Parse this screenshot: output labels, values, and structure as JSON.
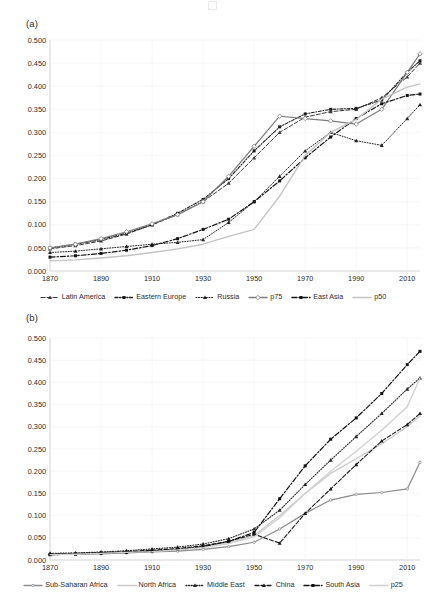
{
  "figure": {
    "width": 426,
    "height": 596,
    "background": "#ffffff",
    "axis_color": "#d9d9d9",
    "grid_color": "#f0f0f0",
    "text_color": "#2b2b2b"
  },
  "panels": [
    {
      "id": "a",
      "label": "(a)",
      "legend_position": "bottom"
    },
    {
      "id": "b",
      "label": "(b)",
      "legend_position": "bottom"
    }
  ],
  "chart_data": [
    {
      "type": "line",
      "panel": "(a)",
      "title": "",
      "xlabel": "",
      "ylabel": "",
      "xlim": [
        1870,
        2015
      ],
      "ylim": [
        0.0,
        0.5
      ],
      "xticks": [
        1870,
        1890,
        1910,
        1930,
        1950,
        1970,
        1990,
        2010
      ],
      "yticks": [
        0.0,
        0.05,
        0.1,
        0.15,
        0.2,
        0.25,
        0.3,
        0.35,
        0.4,
        0.45,
        0.5
      ],
      "ytick_labels": [
        "0.000",
        "0.050",
        "0.100",
        "0.150",
        "0.200",
        "0.250",
        "0.300",
        "0.350",
        "0.400",
        "0.450",
        "0.500"
      ],
      "xtick_labels": [
        "1870",
        "1890",
        "1910",
        "1930",
        "1950",
        "1970",
        "1990",
        "2010"
      ],
      "grid": true,
      "legend": [
        "Latin America",
        "Eastern Europe",
        "Russia",
        "p75",
        "East Asia",
        "p50"
      ],
      "series": [
        {
          "name": "Latin America",
          "color": "#3a3a3a",
          "dash": "4,2",
          "width": 1.0,
          "marker": "triangle",
          "x": [
            1870,
            1880,
            1890,
            1900,
            1910,
            1920,
            1930,
            1940,
            1950,
            1960,
            1970,
            1980,
            1990,
            2000,
            2010,
            2015
          ],
          "values": [
            0.048,
            0.055,
            0.065,
            0.08,
            0.1,
            0.122,
            0.15,
            0.19,
            0.245,
            0.3,
            0.333,
            0.345,
            0.35,
            0.375,
            0.42,
            0.45
          ]
        },
        {
          "name": "Eastern Europe",
          "color": "#1b1b1b",
          "dash": "3,1.6,1,1.6",
          "width": 1.1,
          "marker": "square",
          "x": [
            1870,
            1880,
            1890,
            1900,
            1910,
            1920,
            1930,
            1940,
            1950,
            1960,
            1970,
            1980,
            1990,
            2000,
            2010,
            2015
          ],
          "values": [
            0.05,
            0.058,
            0.068,
            0.082,
            0.1,
            0.125,
            0.155,
            0.2,
            0.26,
            0.312,
            0.34,
            0.35,
            0.352,
            0.37,
            0.43,
            0.455
          ]
        },
        {
          "name": "Russia",
          "color": "#232323",
          "dash": "1,1.6",
          "width": 1.0,
          "marker": "triangle",
          "x": [
            1870,
            1880,
            1890,
            1900,
            1910,
            1920,
            1930,
            1940,
            1950,
            1960,
            1970,
            1980,
            1990,
            2000,
            2010,
            2015
          ],
          "values": [
            0.04,
            0.043,
            0.048,
            0.053,
            0.058,
            0.062,
            0.068,
            0.105,
            0.15,
            0.205,
            0.26,
            0.3,
            0.282,
            0.272,
            0.33,
            0.36
          ]
        },
        {
          "name": "p75",
          "color": "#7d7d7d",
          "dash": "0",
          "width": 1.2,
          "marker": "diamond",
          "x": [
            1870,
            1880,
            1890,
            1900,
            1910,
            1920,
            1930,
            1940,
            1950,
            1960,
            1970,
            1980,
            1990,
            2000,
            2010,
            2015
          ],
          "values": [
            0.05,
            0.058,
            0.07,
            0.085,
            0.102,
            0.122,
            0.15,
            0.205,
            0.27,
            0.335,
            0.33,
            0.325,
            0.318,
            0.35,
            0.43,
            0.47
          ]
        },
        {
          "name": "East Asia",
          "color": "#141414",
          "dash": "5,2,1.4,2",
          "width": 1.2,
          "marker": "square",
          "x": [
            1870,
            1880,
            1890,
            1900,
            1910,
            1920,
            1930,
            1940,
            1950,
            1960,
            1970,
            1980,
            1990,
            2000,
            2010,
            2015
          ],
          "values": [
            0.03,
            0.033,
            0.038,
            0.045,
            0.055,
            0.07,
            0.09,
            0.112,
            0.15,
            0.195,
            0.245,
            0.29,
            0.33,
            0.362,
            0.38,
            0.383
          ]
        },
        {
          "name": "p50",
          "color": "#c3c3c3",
          "dash": "0",
          "width": 1.4,
          "marker": "none",
          "x": [
            1870,
            1880,
            1890,
            1900,
            1910,
            1920,
            1930,
            1940,
            1950,
            1960,
            1970,
            1980,
            1990,
            2000,
            2010,
            2015
          ],
          "values": [
            0.022,
            0.024,
            0.028,
            0.033,
            0.04,
            0.048,
            0.058,
            0.075,
            0.09,
            0.162,
            0.25,
            0.3,
            0.328,
            0.372,
            0.398,
            0.405
          ]
        }
      ]
    },
    {
      "type": "line",
      "panel": "(b)",
      "title": "",
      "xlabel": "",
      "ylabel": "",
      "xlim": [
        1870,
        2015
      ],
      "ylim": [
        0.0,
        0.5
      ],
      "xticks": [
        1870,
        1890,
        1910,
        1930,
        1950,
        1970,
        1990,
        2010
      ],
      "yticks": [
        0.0,
        0.05,
        0.1,
        0.15,
        0.2,
        0.25,
        0.3,
        0.35,
        0.4,
        0.45,
        0.5
      ],
      "ytick_labels": [
        "0.000",
        "0.050",
        "0.100",
        "0.150",
        "0.200",
        "0.250",
        "0.300",
        "0.350",
        "0.400",
        "0.450",
        "0.500"
      ],
      "xtick_labels": [
        "1870",
        "1890",
        "1910",
        "1930",
        "1950",
        "1970",
        "1990",
        "2010"
      ],
      "grid": true,
      "legend": [
        "Sub-Saharan Africa",
        "North Africa",
        "Middle East",
        "China",
        "South Asia",
        "p25"
      ],
      "series": [
        {
          "name": "Sub-Saharan Africa",
          "color": "#8a8a8a",
          "dash": "0",
          "width": 1.2,
          "marker": "dot",
          "x": [
            1870,
            1880,
            1890,
            1900,
            1910,
            1920,
            1930,
            1940,
            1950,
            1960,
            1970,
            1980,
            1990,
            2000,
            2010,
            2015
          ],
          "values": [
            0.012,
            0.013,
            0.014,
            0.016,
            0.018,
            0.02,
            0.024,
            0.03,
            0.04,
            0.07,
            0.105,
            0.135,
            0.148,
            0.152,
            0.16,
            0.22
          ]
        },
        {
          "name": "North Africa",
          "color": "#c9c9c9",
          "dash": "0",
          "width": 1.3,
          "marker": "none",
          "x": [
            1870,
            1880,
            1890,
            1900,
            1910,
            1920,
            1930,
            1940,
            1950,
            1960,
            1970,
            1980,
            1990,
            2000,
            2010,
            2015
          ],
          "values": [
            0.013,
            0.014,
            0.016,
            0.018,
            0.021,
            0.024,
            0.03,
            0.04,
            0.055,
            0.1,
            0.15,
            0.195,
            0.228,
            0.262,
            0.3,
            0.325
          ]
        },
        {
          "name": "Middle East",
          "color": "#262626",
          "dash": "1,1.6",
          "width": 1.1,
          "marker": "triangle",
          "x": [
            1870,
            1880,
            1890,
            1900,
            1910,
            1920,
            1930,
            1940,
            1950,
            1960,
            1970,
            1980,
            1990,
            2000,
            2010,
            2015
          ],
          "values": [
            0.015,
            0.016,
            0.018,
            0.021,
            0.025,
            0.029,
            0.036,
            0.048,
            0.07,
            0.112,
            0.17,
            0.225,
            0.278,
            0.33,
            0.385,
            0.41
          ]
        },
        {
          "name": "China",
          "color": "#1a1a1a",
          "dash": "4,2",
          "width": 1.1,
          "marker": "triangle",
          "x": [
            1870,
            1880,
            1890,
            1900,
            1910,
            1920,
            1930,
            1940,
            1950,
            1960,
            1970,
            1980,
            1990,
            2000,
            2010,
            2015
          ],
          "values": [
            0.014,
            0.015,
            0.017,
            0.019,
            0.022,
            0.026,
            0.032,
            0.042,
            0.058,
            0.038,
            0.105,
            0.16,
            0.215,
            0.268,
            0.305,
            0.33
          ]
        },
        {
          "name": "South Asia",
          "color": "#111111",
          "dash": "5,2,1.4,2",
          "width": 1.2,
          "marker": "square",
          "x": [
            1870,
            1880,
            1890,
            1900,
            1910,
            1920,
            1930,
            1940,
            1950,
            1960,
            1970,
            1980,
            1990,
            2000,
            2010,
            2015
          ],
          "values": [
            0.012,
            0.013,
            0.015,
            0.017,
            0.02,
            0.024,
            0.03,
            0.042,
            0.062,
            0.138,
            0.212,
            0.272,
            0.32,
            0.375,
            0.44,
            0.47
          ]
        },
        {
          "name": "p25",
          "color": "#cfcfcf",
          "dash": "0",
          "width": 1.3,
          "marker": "none",
          "x": [
            1870,
            1880,
            1890,
            1900,
            1910,
            1920,
            1930,
            1940,
            1950,
            1960,
            1970,
            1980,
            1990,
            2000,
            2010,
            2015
          ],
          "values": [
            0.012,
            0.013,
            0.015,
            0.017,
            0.019,
            0.023,
            0.028,
            0.037,
            0.052,
            0.095,
            0.15,
            0.2,
            0.245,
            0.292,
            0.345,
            0.41
          ]
        }
      ]
    }
  ]
}
